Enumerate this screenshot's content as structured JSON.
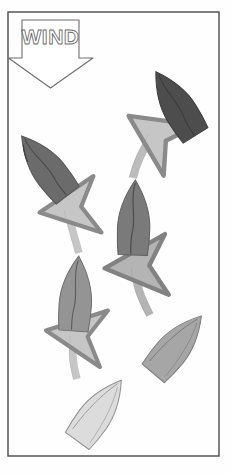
{
  "figure": {
    "background_color": "#fefefe",
    "frame": {
      "name": "outer-frame",
      "x": 8,
      "y": 12,
      "width": 211,
      "height": 444,
      "stroke_color": "#4a4a4a",
      "stroke_width": 1.4,
      "fill": "none"
    },
    "wind_indicator": {
      "label": "WIND",
      "label_style": "outline",
      "label_color": "#6d6d6d",
      "arrow_direction": "down",
      "arrow_stroke_color": "#6d6d6d",
      "arrow_fill": "#ffffff",
      "arrow_points": "22,20 79,20 79,58 93,58 50.5,88 8.5,58 22,58"
    },
    "palette": {
      "boat_darkest": "#4f4f4f",
      "boat_dark": "#6e6e6e",
      "boat_mid_dark": "#7c7c7c",
      "boat_mid": "#8d8d8d",
      "boat_light": "#a9a9a9",
      "boat_lightest": "#d9d9d9",
      "boat_outline": "#6a6a6a",
      "arrow_fill": "#bdbdbd",
      "arrow_fill_light": "#cfcfcf",
      "arrow_outline": "#8a8a8a"
    },
    "tracks": [
      {
        "name": "left-track",
        "description": "Left boat track beating upwind",
        "boats": [
          {
            "name": "boat-left-1-start",
            "order": 1,
            "tone": "lightest",
            "fill": "#dcdcdc",
            "cx": 99,
            "cy": 411,
            "rotation": 36,
            "length": 74,
            "beam": 33
          },
          {
            "name": "boat-left-2",
            "order": 2,
            "tone": "mid",
            "fill": "#949494",
            "cx": 76,
            "cy": 294,
            "rotation": 4,
            "length": 76,
            "beam": 32
          },
          {
            "name": "boat-left-3",
            "order": 3,
            "tone": "dark",
            "fill": "#6b6b6b",
            "cx": 45,
            "cy": 166,
            "rotation": -38,
            "length": 78,
            "beam": 33
          }
        ],
        "arrows": [
          {
            "name": "arrow-left-lower",
            "from_boat": "boat-left-1-start",
            "to_boat": "boat-left-2",
            "fill": "#c6c6c6",
            "path": "M 77,379 C 72,360 72,350 74,336"
          },
          {
            "name": "arrow-left-upper",
            "from_boat": "boat-left-2",
            "to_boat": "boat-left-3",
            "fill": "#c6c6c6",
            "path": "M 79,253 C 74,234 70,224 68,210"
          }
        ]
      },
      {
        "name": "right-track",
        "description": "Right boat track beating upwind",
        "boats": [
          {
            "name": "boat-right-1-start",
            "order": 1,
            "tone": "light",
            "fill": "#a6a6a6",
            "cx": 177,
            "cy": 345,
            "rotation": 40,
            "length": 74,
            "beam": 32
          },
          {
            "name": "boat-right-2",
            "order": 2,
            "tone": "mid-dark",
            "fill": "#7a7a7a",
            "cx": 134,
            "cy": 218,
            "rotation": 2,
            "length": 78,
            "beam": 32
          },
          {
            "name": "boat-right-3",
            "order": 3,
            "tone": "darkest",
            "fill": "#4d4d4d",
            "cx": 176,
            "cy": 104,
            "rotation": -32,
            "length": 80,
            "beam": 33
          }
        ],
        "arrows": [
          {
            "name": "arrow-right-lower",
            "from_boat": "boat-right-1-start",
            "to_boat": "boat-right-2",
            "fill": "#b4b4b4",
            "path": "M 150,315 C 140,296 136,284 135,268"
          },
          {
            "name": "arrow-right-upper",
            "from_boat": "boat-right-2",
            "to_boat": "boat-right-3",
            "fill": "#bcbcbc",
            "path": "M 133,178 C 137,160 145,146 153,134"
          }
        ]
      }
    ]
  }
}
